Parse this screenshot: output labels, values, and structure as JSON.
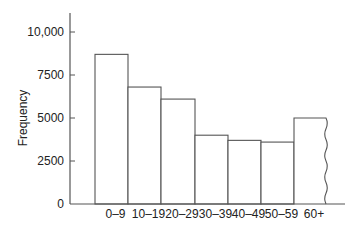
{
  "chart_data": {
    "type": "bar",
    "title": "",
    "xlabel": "",
    "ylabel": "Frequency",
    "categories": [
      "0–9",
      "10–19",
      "20–29",
      "30–39",
      "40–49",
      "50–59",
      "60+"
    ],
    "values": [
      8700,
      6800,
      6100,
      4000,
      3700,
      3600,
      5000
    ],
    "ylim": [
      0,
      11000
    ],
    "yticks": [
      0,
      2500,
      5000,
      7500,
      10000
    ],
    "ytick_labels": [
      "0",
      "2500",
      "5000",
      "7500",
      "10,000"
    ],
    "grid": false,
    "legend": null,
    "annotations": [
      "Last bar (60+) drawn with a wavy right edge indicating an open-ended interval"
    ],
    "bar_style": {
      "fill": "#ffffff",
      "stroke": "#555555"
    }
  }
}
